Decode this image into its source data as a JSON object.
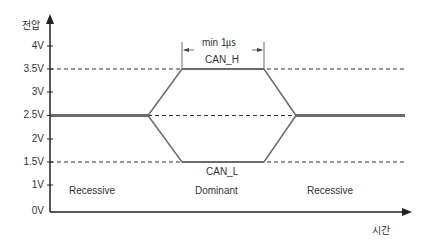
{
  "diagram": {
    "y_axis": {
      "label": "전압",
      "ticks": [
        "4V",
        "3.5V",
        "3V",
        "2.5V",
        "2V",
        "1.5V",
        "1V",
        "0V"
      ]
    },
    "x_axis": {
      "label": "시간"
    },
    "signals": {
      "can_h": "CAN_H",
      "can_l": "CAN_L"
    },
    "timing": {
      "label": "min 1㎲"
    },
    "states": {
      "left": "Recessive",
      "middle": "Dominant",
      "right": "Recessive"
    },
    "levels": {
      "high": "3.5V",
      "recessive": "2.5V",
      "low": "1.5V"
    },
    "colors": {
      "axis": "#222222",
      "signal": "#6b6b6b",
      "dashed": "#333333",
      "text": "#333333"
    }
  }
}
